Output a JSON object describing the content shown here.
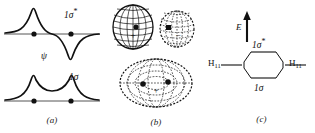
{
  "figure": {
    "background_color": "#ffffff",
    "ink_color": "#1a1a1a",
    "width": 315,
    "height": 133
  },
  "panels": [
    {
      "id": "a",
      "caption": "(a)",
      "description": "Wavefunction amplitude plots along the internuclear axis",
      "axis_label": "ψ",
      "curves": [
        {
          "name": "antibonding",
          "label_base": "1σ",
          "label_star": "*",
          "nodes": 1
        },
        {
          "name": "bonding",
          "label_base": "1σ",
          "label_star": "",
          "nodes": 0
        }
      ],
      "nuclei_count": 2
    },
    {
      "id": "b",
      "caption": "(b)",
      "description": "Three-dimensional boundary-surface contour representations",
      "shapes": [
        {
          "name": "antibonding-lobe-left",
          "sign": "+",
          "line_style": "solid"
        },
        {
          "name": "antibonding-lobe-right",
          "sign": "−",
          "line_style": "dashed"
        },
        {
          "name": "bonding-ellipsoid",
          "sign": "+",
          "line_style": "dashed"
        }
      ]
    },
    {
      "id": "c",
      "caption": "(c)",
      "description": "Molecular orbital energy level correlation diagram",
      "energy_axis_label": "E",
      "levels": [
        {
          "name": "antibonding-level",
          "label_base": "1σ",
          "label_star": "*"
        },
        {
          "name": "bonding-level",
          "label_base": "1σ",
          "label_star": ""
        }
      ],
      "atomic_orbitals": [
        {
          "name": "left-atomic-orbital",
          "element": "H",
          "subscript": "11"
        },
        {
          "name": "right-atomic-orbital",
          "element": "H",
          "subscript": "11"
        }
      ]
    }
  ]
}
